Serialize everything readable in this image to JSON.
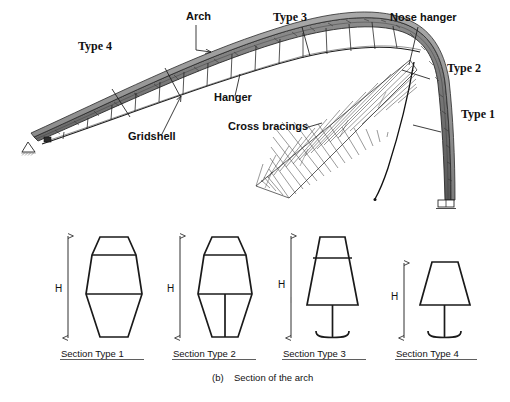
{
  "figure": {
    "caption_marker": "(b)",
    "caption_text": "Section of the arch",
    "dim_symbol": "H"
  },
  "diagram_a": {
    "labels": [
      {
        "id": "arch",
        "text": "Arch",
        "style": "sans",
        "x": 186,
        "y": 20
      },
      {
        "id": "type-4",
        "text": "Type 4",
        "style": "serif",
        "x": 78,
        "y": 50
      },
      {
        "id": "type-3",
        "text": "Type 3",
        "style": "serif",
        "x": 273,
        "y": 21
      },
      {
        "id": "nose-hanger",
        "text": "Nose hanger",
        "style": "sans",
        "x": 390,
        "y": 21
      },
      {
        "id": "type-2",
        "text": "Type 2",
        "style": "serif",
        "x": 447,
        "y": 72
      },
      {
        "id": "type-1",
        "text": "Type 1",
        "style": "serif",
        "x": 461,
        "y": 118
      },
      {
        "id": "hanger",
        "text": "Hanger",
        "style": "sans",
        "x": 214,
        "y": 101
      },
      {
        "id": "gridshell",
        "text": "Gridshell",
        "style": "sans",
        "x": 128,
        "y": 140
      },
      {
        "id": "cross-bracings",
        "text": "Cross bracings",
        "style": "sans",
        "x": 228,
        "y": 130
      }
    ],
    "supports": {
      "left": "pin-support",
      "right": "roller-support"
    }
  },
  "sections": [
    {
      "id": "section-type-1",
      "caption": "Section Type 1",
      "dim_label": "H",
      "shape": "hexagon-capped-segmented",
      "height_rel": 1.0
    },
    {
      "id": "section-type-2",
      "caption": "Section Type 2",
      "dim_label": "H",
      "shape": "hexagon-capped-webbed",
      "height_rel": 1.0
    },
    {
      "id": "section-type-3",
      "caption": "Section Type 3",
      "dim_label": "H",
      "shape": "trapezoid-stem-foot",
      "height_rel": 1.0
    },
    {
      "id": "section-type-4",
      "caption": "Section Type 4",
      "dim_label": "H",
      "shape": "trapezoid-stem-foot-short",
      "height_rel": 0.74
    }
  ]
}
